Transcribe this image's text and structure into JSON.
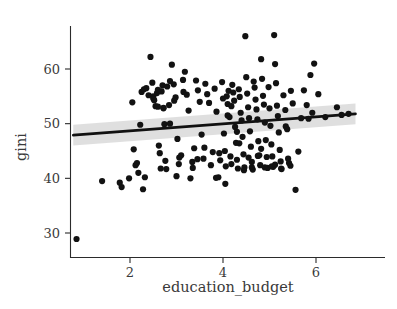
{
  "chart_data": {
    "type": "scatter",
    "title": "",
    "subtitle": "",
    "xlabel": "education_budget",
    "ylabel": "gini",
    "xlim": [
      0.55,
      7.1
    ],
    "ylim": [
      27.0,
      67.5
    ],
    "xticks": [
      2,
      4,
      6
    ],
    "xticklabels": [
      "2",
      "4",
      "6"
    ],
    "yticks": [
      30,
      40,
      50,
      60
    ],
    "yticklabels": [
      "30",
      "40",
      "50",
      "60"
    ],
    "grid": false,
    "legend": null,
    "point_color": "#121212",
    "line_color": "#111111",
    "band_color": "#d9d9d9",
    "axis_color": "#2b2b2b",
    "background": "#ffffff",
    "regression": {
      "type": "linear-fit-with-ci",
      "x_start": 0.78,
      "y_start": 47.9,
      "x_end": 6.85,
      "y_end": 51.8,
      "ci_low_start": 46.0,
      "ci_high_start": 49.8,
      "ci_low_end": 49.9,
      "ci_high_end": 53.7
    },
    "x": [
      0.85,
      1.4,
      1.78,
      1.82,
      1.98,
      2.05,
      2.08,
      2.12,
      2.18,
      2.22,
      2.25,
      2.28,
      2.32,
      2.35,
      2.4,
      2.44,
      2.48,
      2.5,
      2.52,
      2.55,
      2.58,
      2.6,
      2.62,
      2.64,
      2.66,
      2.68,
      2.7,
      2.72,
      2.74,
      2.76,
      2.78,
      2.8,
      2.84,
      2.86,
      2.9,
      2.94,
      2.98,
      3.02,
      3.06,
      3.1,
      3.14,
      3.18,
      3.22,
      3.26,
      3.3,
      3.34,
      3.38,
      3.42,
      3.46,
      3.5,
      3.54,
      3.58,
      3.62,
      3.66,
      3.7,
      3.74,
      3.78,
      3.82,
      3.86,
      3.9,
      3.94,
      3.98,
      4.0,
      4.02,
      4.04,
      4.06,
      4.08,
      4.1,
      4.12,
      4.14,
      4.16,
      4.18,
      4.2,
      4.22,
      4.24,
      4.26,
      4.28,
      4.3,
      4.32,
      4.34,
      4.36,
      4.38,
      4.4,
      4.42,
      4.44,
      4.46,
      4.48,
      4.5,
      4.52,
      4.54,
      4.56,
      4.58,
      4.6,
      4.62,
      4.64,
      4.66,
      4.68,
      4.7,
      4.72,
      4.74,
      4.76,
      4.78,
      4.8,
      4.82,
      4.84,
      4.86,
      4.88,
      4.9,
      4.92,
      4.94,
      4.96,
      4.98,
      5.0,
      5.02,
      5.04,
      5.06,
      5.08,
      5.1,
      5.12,
      5.14,
      5.16,
      5.18,
      5.2,
      5.22,
      5.24,
      5.26,
      5.3,
      5.34,
      5.38,
      5.42,
      5.46,
      5.5,
      5.56,
      5.62,
      5.68,
      5.74,
      5.8,
      5.84,
      5.88,
      5.92,
      5.96,
      6.05,
      6.2,
      6.45,
      6.55,
      6.7,
      2.3,
      2.72,
      3.0,
      3.35,
      3.6,
      4.05,
      4.45,
      4.9,
      5.25,
      2.95,
      3.15,
      4.35,
      4.55,
      5.05,
      2.5,
      2.6,
      3.05,
      3.45,
      4.1,
      4.62,
      5.12,
      5.4,
      2.15,
      3.85,
      4.3,
      4.75,
      5.45,
      2.86,
      3.92,
      4.18,
      4.82,
      5.35
    ],
    "y": [
      28.9,
      39.5,
      39.2,
      38.4,
      40.0,
      53.9,
      45.3,
      42.4,
      41.0,
      49.8,
      55.8,
      38.0,
      40.2,
      56.5,
      55.2,
      62.2,
      57.5,
      55.0,
      54.3,
      53.2,
      55.6,
      56.2,
      46.0,
      44.6,
      41.8,
      55.9,
      57.0,
      52.9,
      49.9,
      43.2,
      41.7,
      56.8,
      53.4,
      50.0,
      60.8,
      57.2,
      54.8,
      47.2,
      43.8,
      44.2,
      58.0,
      59.5,
      55.3,
      52.4,
      40.0,
      43.0,
      45.5,
      57.9,
      56.1,
      54.0,
      48.0,
      43.6,
      57.3,
      55.4,
      53.8,
      42.4,
      44.8,
      56.4,
      52.2,
      40.2,
      43.3,
      57.6,
      54.6,
      48.2,
      45.0,
      42.2,
      55.0,
      53.6,
      56.0,
      51.2,
      44.0,
      42.6,
      57.1,
      55.7,
      54.2,
      49.4,
      46.5,
      43.4,
      41.8,
      56.3,
      54.9,
      52.0,
      50.6,
      47.6,
      44.4,
      42.0,
      66.0,
      58.5,
      55.5,
      53.0,
      51.0,
      48.6,
      45.8,
      43.0,
      41.6,
      57.7,
      56.6,
      54.4,
      52.6,
      50.8,
      46.8,
      44.2,
      42.4,
      61.8,
      58.2,
      55.1,
      53.5,
      50.2,
      47.0,
      43.9,
      41.9,
      56.7,
      52.8,
      49.6,
      46.2,
      44.0,
      42.1,
      66.2,
      60.9,
      57.4,
      53.3,
      51.4,
      48.4,
      45.2,
      43.1,
      41.7,
      55.2,
      52.5,
      49.0,
      42.8,
      56.0,
      53.7,
      37.9,
      44.9,
      51.0,
      56.1,
      53.4,
      50.9,
      58.9,
      52.0,
      61.0,
      55.4,
      51.2,
      53.0,
      51.6,
      51.8,
      56.3,
      52.8,
      40.4,
      41.9,
      45.6,
      39.0,
      41.5,
      42.0,
      41.8,
      54.2,
      55.8,
      46.4,
      43.8,
      42.2,
      54.6,
      53.1,
      42.6,
      43.5,
      51.5,
      42.0,
      42.5,
      43.6,
      42.8,
      40.1,
      48.5,
      44.1,
      42.3,
      57.8,
      44.6,
      53.2,
      45.4,
      49.5
    ]
  },
  "axes": {
    "x_title": "education_budget",
    "y_title": "gini"
  }
}
